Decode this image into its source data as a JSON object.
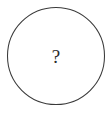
{
  "figure": {
    "type": "diagram",
    "background_color": "#ffffff",
    "canvas": {
      "width": 112,
      "height": 113
    },
    "shape": {
      "name": "circle-outline",
      "kind": "circle",
      "center_x": 56,
      "center_y": 56,
      "radius": 48.5,
      "stroke_color": "#3a3a3a",
      "stroke_width": 1,
      "fill_color": "#ffffff"
    },
    "label": {
      "text": "?",
      "color": "#2a2a2a",
      "font_size_px": 19,
      "center_x": 56,
      "center_y": 56
    }
  }
}
